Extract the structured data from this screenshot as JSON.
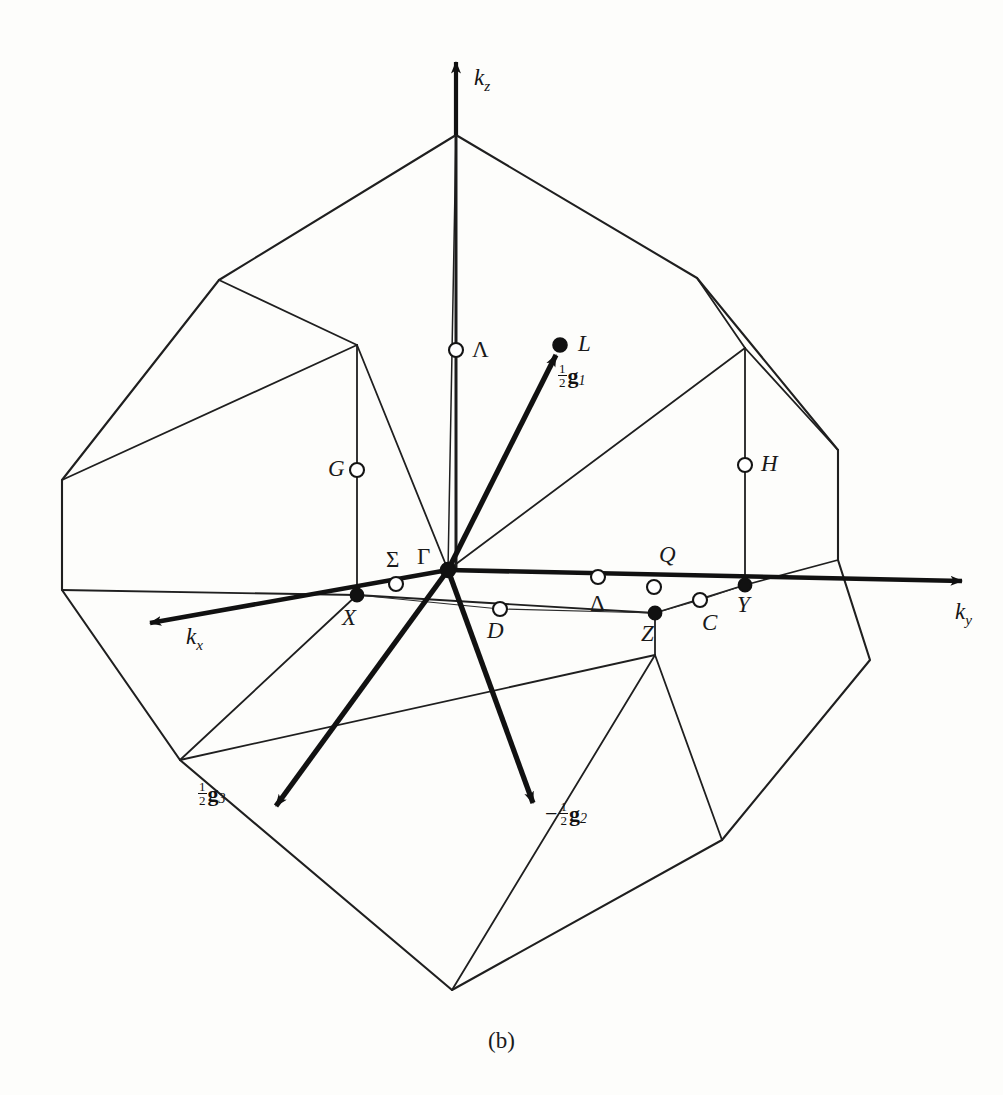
{
  "figure": {
    "caption": "(b)",
    "line_color": "#1a1a1a",
    "point_fill_filled": "#111111",
    "point_fill_open": "#ffffff",
    "background": "#fdfdfb"
  },
  "axes": [
    {
      "name": "kz",
      "label_main": "k",
      "label_sub": "z",
      "x": 474,
      "y": 66,
      "tip": [
        456,
        60
      ],
      "tail": [
        456,
        135
      ]
    },
    {
      "name": "ky",
      "label_main": "k",
      "label_sub": "y",
      "x": 955,
      "y": 607,
      "tip": [
        975,
        580
      ],
      "tail": [
        448,
        570
      ]
    },
    {
      "name": "kx",
      "label_main": "k",
      "label_sub": "x",
      "x": 186,
      "y": 628,
      "tip": [
        140,
        624
      ],
      "tail": [
        448,
        570
      ]
    }
  ],
  "reciprocal_vectors": [
    {
      "name": "half-g1",
      "sign": "",
      "num": "1",
      "den": "2",
      "bold": "g",
      "sub": "1",
      "x": 556,
      "y": 368,
      "tip": [
        560,
        345
      ],
      "tail": [
        448,
        570
      ]
    },
    {
      "name": "minus-half-g2",
      "sign": "−",
      "num": "1",
      "den": "2",
      "bold": "g",
      "sub": "2",
      "x": 546,
      "y": 807,
      "tip": [
        535,
        810
      ],
      "tail": [
        448,
        570
      ]
    },
    {
      "name": "half-g3",
      "sign": "",
      "num": "1",
      "den": "2",
      "bold": "g",
      "sub": "3",
      "x": 200,
      "y": 785,
      "tip": [
        283,
        812
      ],
      "tail": [
        448,
        570
      ]
    }
  ],
  "symmetry_points": [
    {
      "label": "Γ",
      "name": "gamma",
      "x": 448,
      "y": 570,
      "type": "filled",
      "lx": 417,
      "ly": 546,
      "upright": true
    },
    {
      "label": "L",
      "name": "L",
      "x": 560,
      "y": 345,
      "type": "filled",
      "lx": 578,
      "ly": 334,
      "upright": false
    },
    {
      "label": "X",
      "name": "X",
      "x": 357,
      "y": 595,
      "type": "filled",
      "lx": 343,
      "ly": 609,
      "upright": false
    },
    {
      "label": "Y",
      "name": "Y",
      "x": 745,
      "y": 585,
      "type": "filled",
      "lx": 737,
      "ly": 597,
      "upright": false
    },
    {
      "label": "Z",
      "name": "Z",
      "x": 655,
      "y": 613,
      "type": "filled",
      "lx": 641,
      "ly": 624,
      "upright": false
    },
    {
      "label": "Λ",
      "name": "Lambda",
      "x": 456,
      "y": 350,
      "type": "open",
      "lx": 472,
      "ly": 340,
      "upright": true
    },
    {
      "label": "G",
      "name": "G",
      "x": 357,
      "y": 470,
      "type": "open",
      "lx": 329,
      "ly": 458,
      "upright": false
    },
    {
      "label": "H",
      "name": "H",
      "x": 745,
      "y": 465,
      "type": "open",
      "lx": 761,
      "ly": 454,
      "upright": false
    },
    {
      "label": "Σ",
      "name": "Sigma",
      "x": 396,
      "y": 584,
      "type": "open",
      "lx": 385,
      "ly": 551,
      "upright": true
    },
    {
      "label": "Δ",
      "name": "Delta",
      "x": 598,
      "y": 577,
      "type": "open",
      "lx": 590,
      "ly": 595,
      "upright": true
    },
    {
      "label": "Q",
      "name": "Q",
      "x": 654,
      "y": 587,
      "type": "open",
      "lx": 659,
      "ly": 546,
      "upright": false
    },
    {
      "label": "D",
      "name": "D",
      "x": 500,
      "y": 609,
      "type": "open",
      "lx": 487,
      "ly": 622,
      "upright": false
    },
    {
      "label": "C",
      "name": "C",
      "x": 700,
      "y": 600,
      "type": "open",
      "lx": 703,
      "ly": 614,
      "upright": false
    }
  ],
  "geometry": {
    "outer_outline": "M456,135 L219,280 L62,480 L62,590 L180,760 L452,990 L722,840 L870,660 L838,560 L838,450 L697,278 Z",
    "top_facets": [
      "M456,135 L357,345 L219,280",
      "M456,135 L357,345 L448,570",
      "M456,135 L448,570 L745,348",
      "M456,135 L745,348 L697,278"
    ],
    "inner_edges": [
      "M357,345 L219,280",
      "M357,345 L448,570",
      "M456,135 L448,570",
      "M448,570 L745,348",
      "M745,348 L697,278",
      "M357,345 L357,595",
      "M745,348 L745,585",
      "M357,345 L62,480",
      "M745,348 L838,450",
      "M357,595 L62,590",
      "M745,585 L838,560",
      "M357,595 L655,613",
      "M357,595 L448,570",
      "M448,570 L745,585",
      "M655,613 L745,585",
      "M357,595 L180,760",
      "M655,613 L655,655",
      "M655,655 L452,990",
      "M655,655 L722,840",
      "M180,760 L452,990",
      "M180,760 L655,655",
      "M62,590 L180,760",
      "M838,560 L870,660",
      "M870,660 L722,840",
      "M722,840 L452,990",
      "M62,480 L62,590",
      "M838,450 L838,560",
      "M62,480 L219,280",
      "M838,450 L697,278",
      "M219,280 L456,135",
      "M697,278 L456,135"
    ]
  }
}
